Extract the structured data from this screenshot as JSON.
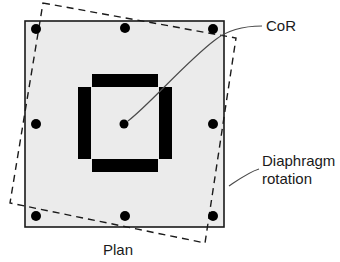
{
  "figure": {
    "caption": "Plan",
    "colors": {
      "slab_fill": "#ebebeb",
      "outline": "#1a1a1a",
      "core_wall": "#000000",
      "column": "#000000",
      "dashed": "#1a1a1a",
      "leader": "#4a4a4a",
      "text": "#1a1a1a"
    }
  },
  "labels": {
    "cor": "CoR",
    "diaphragm_rotation_line1": "Diaphragm",
    "diaphragm_rotation_line2": "rotation",
    "plan": "Plan"
  },
  "geometry": {
    "slab": {
      "x": 25,
      "y": 21,
      "width": 199,
      "height": 206
    },
    "rotated_slab_points": "43,3 236,38 205,243 10,203",
    "center_of_rotation": {
      "x": 124,
      "y": 124,
      "radius": 4.5
    },
    "columns": [
      {
        "name": "column-top-left",
        "x": 36,
        "y": 29,
        "r": 5
      },
      {
        "name": "column-top-center",
        "x": 125,
        "y": 28,
        "r": 5
      },
      {
        "name": "column-top-right",
        "x": 213,
        "y": 29,
        "r": 5
      },
      {
        "name": "column-mid-left",
        "x": 36,
        "y": 124,
        "r": 5
      },
      {
        "name": "column-mid-right",
        "x": 213,
        "y": 124,
        "r": 5
      },
      {
        "name": "column-bottom-left",
        "x": 36,
        "y": 216,
        "r": 5
      },
      {
        "name": "column-bottom-center",
        "x": 125,
        "y": 216,
        "r": 5
      },
      {
        "name": "column-bottom-right",
        "x": 213,
        "y": 216,
        "r": 5
      }
    ],
    "core_walls": [
      {
        "name": "core-wall-top",
        "x": 92,
        "y": 74,
        "width": 66,
        "height": 13
      },
      {
        "name": "core-wall-left",
        "x": 78,
        "y": 87,
        "width": 13,
        "height": 72
      },
      {
        "name": "core-wall-right",
        "x": 159,
        "y": 87,
        "width": 13,
        "height": 72
      },
      {
        "name": "core-wall-bottom",
        "x": 92,
        "y": 159,
        "width": 66,
        "height": 13
      }
    ],
    "leaders": {
      "cor_leader": "M 128 121 C 150 104 186 62 215 40 C 230 28 248 26 262 26",
      "rotation_leader": "M 231 183 C 240 178 250 172 258 170"
    }
  },
  "text_positions": {
    "cor": {
      "x": 266,
      "y": 31
    },
    "diaphragm_line1": {
      "x": 262,
      "y": 166
    },
    "diaphragm_line2": {
      "x": 262,
      "y": 184
    },
    "plan": {
      "x": 103,
      "y": 255
    }
  }
}
